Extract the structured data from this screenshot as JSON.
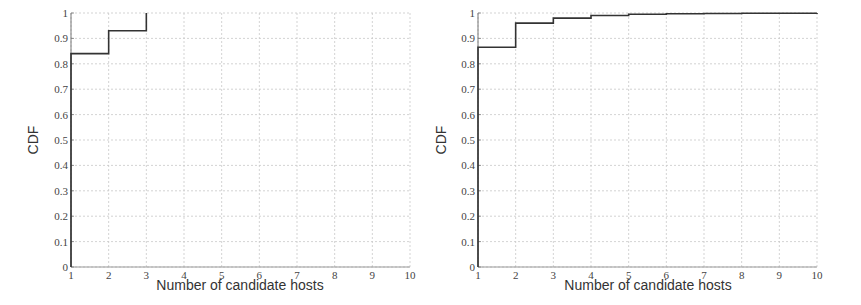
{
  "chart_data": [
    {
      "type": "line",
      "step": true,
      "title": "",
      "xlabel": "Number of candidate hosts",
      "ylabel": "CDF",
      "xlim": [
        1,
        10
      ],
      "ylim": [
        0,
        1
      ],
      "x_ticks": [
        "1",
        "2",
        "3",
        "4",
        "5",
        "6",
        "7",
        "8",
        "9",
        "10"
      ],
      "y_ticks": [
        "0",
        "0.1",
        "0.2",
        "0.3",
        "0.4",
        "0.5",
        "0.6",
        "0.7",
        "0.8",
        "0.9",
        "1"
      ],
      "grid": true,
      "legend": null,
      "series": [
        {
          "name": "CDF",
          "x": [
            1,
            2,
            3
          ],
          "values": [
            0.84,
            0.93,
            1.0
          ]
        }
      ]
    },
    {
      "type": "line",
      "step": true,
      "title": "",
      "xlabel": "Number of candidate hosts",
      "ylabel": "CDF",
      "xlim": [
        1,
        10
      ],
      "ylim": [
        0,
        1
      ],
      "x_ticks": [
        "1",
        "2",
        "3",
        "4",
        "5",
        "6",
        "7",
        "8",
        "9",
        "10"
      ],
      "y_ticks": [
        "0",
        "0.1",
        "0.2",
        "0.3",
        "0.4",
        "0.5",
        "0.6",
        "0.7",
        "0.8",
        "0.9",
        "1"
      ],
      "grid": true,
      "legend": null,
      "series": [
        {
          "name": "CDF",
          "x": [
            1,
            2,
            3,
            4,
            5,
            6,
            7,
            8,
            9,
            10
          ],
          "values": [
            0.865,
            0.96,
            0.98,
            0.99,
            0.995,
            0.997,
            0.998,
            0.999,
            0.999,
            1.0
          ]
        }
      ]
    }
  ],
  "charts": [
    {
      "xlabel": "Number of candidate hosts",
      "ylabel": "CDF"
    },
    {
      "xlabel": "Number of candidate hosts",
      "ylabel": "CDF"
    }
  ]
}
